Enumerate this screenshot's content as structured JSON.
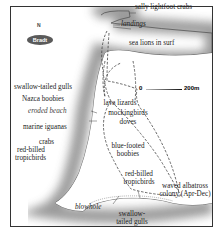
{
  "map": {
    "publisher_badge": "Bradt",
    "north_label": "N",
    "scale": {
      "start": "0",
      "end": "200m"
    },
    "labels": {
      "sally_lightfoot_crabs": "sally lightfoot crabs",
      "landings": "landings",
      "sea_lions": "sea lions in surf",
      "swallow_tailed_gulls_north": "swallow-tailed gulls",
      "nazca_boobies": "Nazca boobies",
      "eroded_beach": "eroded beach",
      "lava_lizards": "lava lizards",
      "mockingbirds": "mockingbirds",
      "doves": "doves",
      "marine_iguanas": "marine iguanas",
      "crabs": "crabs",
      "red_billed_west_1": "red-billed",
      "red_billed_west_2": "tropicbirds",
      "blue_footed_1": "blue-footed",
      "blue_footed_2": "boobies",
      "red_billed_south_1": "red-billed",
      "red_billed_south_2": "tropicbirds",
      "albatross_1": "waved albatross",
      "albatross_2": "colony (Apr-Dec)",
      "blowhole": "blowhole",
      "swallow_tailed_south_1": "swallow-",
      "swallow_tailed_south_2": "tailed gulls"
    },
    "colors": {
      "sea_shadow": "#9a9a9a",
      "land": "#ffffff",
      "frame": "#333333",
      "trail": "#555555"
    }
  }
}
